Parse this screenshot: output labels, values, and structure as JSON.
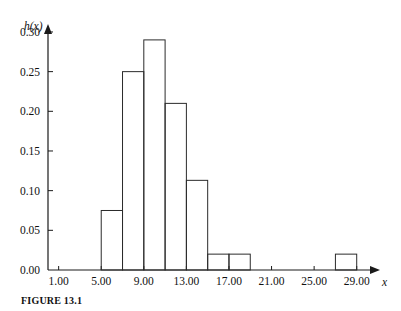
{
  "figure": {
    "caption": "FIGURE 13.1",
    "y_axis_name": "h(x)",
    "x_axis_name": "x"
  },
  "chart_data": {
    "type": "bar",
    "title": "",
    "subtitle": "",
    "xlabel": "x",
    "ylabel": "h(x)",
    "grid": false,
    "legend": "none",
    "xlim": [
      0,
      31
    ],
    "ylim": [
      0.0,
      0.305
    ],
    "bin_width": 2,
    "x_ticks": [
      1.0,
      5.0,
      9.0,
      13.0,
      17.0,
      21.0,
      25.0,
      29.0
    ],
    "x_tick_labels": [
      "1.00",
      "5.00",
      "9.00",
      "13.00",
      "17.00",
      "21.00",
      "25.00",
      "29.00"
    ],
    "y_ticks": [
      0.0,
      0.05,
      0.1,
      0.15,
      0.2,
      0.25,
      0.3
    ],
    "y_tick_labels": [
      "0.00",
      "0.05",
      "0.10",
      "0.15",
      "0.20",
      "0.25",
      "0.30"
    ],
    "bins": [
      {
        "left": 5,
        "right": 7,
        "value": 0.075
      },
      {
        "left": 7,
        "right": 9,
        "value": 0.25
      },
      {
        "left": 9,
        "right": 11,
        "value": 0.29
      },
      {
        "left": 11,
        "right": 13,
        "value": 0.21
      },
      {
        "left": 13,
        "right": 15,
        "value": 0.113
      },
      {
        "left": 15,
        "right": 17,
        "value": 0.02
      },
      {
        "left": 17,
        "right": 19,
        "value": 0.02
      },
      {
        "left": 27,
        "right": 29,
        "value": 0.02
      }
    ],
    "categories": [
      "5-7",
      "7-9",
      "9-11",
      "11-13",
      "13-15",
      "15-17",
      "17-19",
      "27-29"
    ],
    "values": [
      0.075,
      0.25,
      0.29,
      0.21,
      0.113,
      0.02,
      0.02,
      0.02
    ]
  }
}
